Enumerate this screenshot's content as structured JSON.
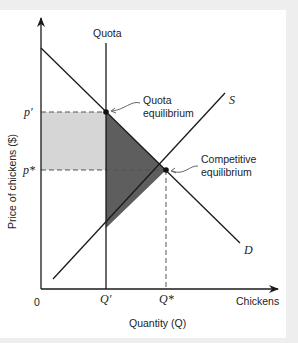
{
  "diagram": {
    "type": "quota-supply-demand",
    "quota_label": "Quota",
    "y_axis_label": "Price of chickens ($)",
    "x_axis_label": "Quantity (Q)",
    "x_axis_end_label": "Chickens",
    "origin_label": "0",
    "price_labels": {
      "p_quota": "p′",
      "p_star": "p*"
    },
    "quantity_labels": {
      "q_quota": "Q′",
      "q_star": "Q*"
    },
    "curve_labels": {
      "supply": "S",
      "demand": "D"
    },
    "annotations": {
      "quota_eq_line1": "Quota",
      "quota_eq_line2": "equilibrium",
      "comp_eq_line1": "Competitive",
      "comp_eq_line2": "equilibrium"
    },
    "colors": {
      "consumer_loss_rect": "#d6d6d6",
      "deadweight_triangle": "#5e5e5e",
      "lines": "#1a1a1a",
      "dashed": "#555555"
    }
  }
}
